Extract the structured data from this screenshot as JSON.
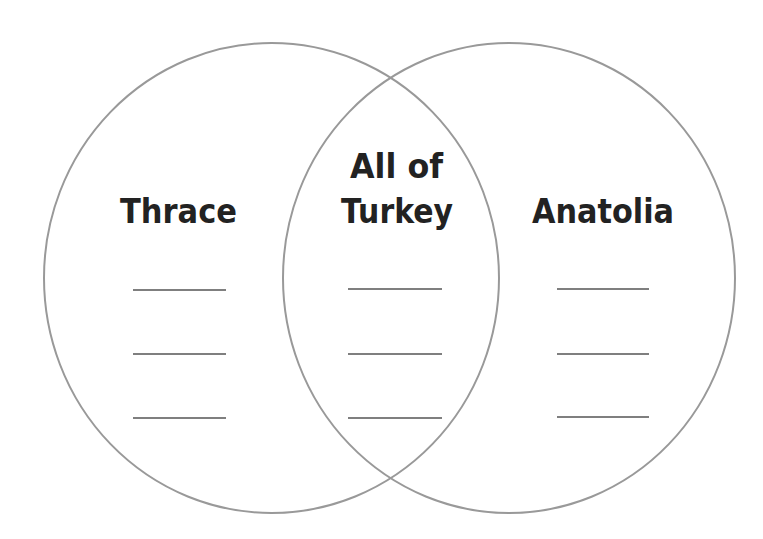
{
  "diagram": {
    "type": "venn",
    "stroke_color": "#999999",
    "text_color": "#222222",
    "line_color": "#555555",
    "left": {
      "label": "Thrace",
      "blank_count": 3
    },
    "center": {
      "label_line1": "All of",
      "label_line2": "Turkey",
      "blank_count": 3
    },
    "right": {
      "label": "Anatolia",
      "blank_count": 3
    }
  }
}
